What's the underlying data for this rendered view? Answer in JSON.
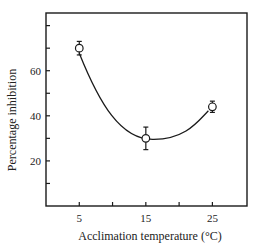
{
  "chart_data": {
    "type": "line",
    "title": "",
    "xlabel": "Acclimation temperature (°C)",
    "ylabel": "Percentage inhibition",
    "x": [
      5,
      15,
      25
    ],
    "series": [
      {
        "name": "Percentage inhibition",
        "values": [
          70,
          30,
          44
        ],
        "error": [
          3,
          5,
          2.5
        ],
        "marker": "open-circle",
        "fit": "smooth-curve"
      }
    ],
    "x_ticks": [
      5,
      10,
      15,
      20,
      25
    ],
    "x_tick_labels": [
      "5",
      "",
      "15",
      "",
      "25"
    ],
    "y_ticks": [
      10,
      20,
      30,
      40,
      50,
      60,
      70,
      80
    ],
    "y_tick_labels": [
      "",
      "20",
      "",
      "40",
      "",
      "60",
      "",
      ""
    ],
    "xlim": [
      0,
      30.2
    ],
    "ylim": [
      0,
      85.6
    ],
    "grid": false,
    "legend": "none"
  },
  "colors": {
    "ink": "#1a1a1a",
    "background": "#ffffff"
  }
}
